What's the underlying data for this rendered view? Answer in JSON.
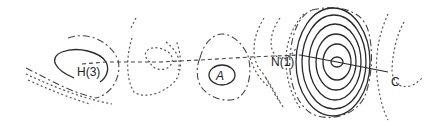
{
  "diagram": {
    "type": "contour-map",
    "labels": {
      "h3": "H(3)",
      "a": "A",
      "n1": "N(1)",
      "c": "C"
    },
    "contour_styles": {
      "positive": "solid",
      "zero": "dash-dot",
      "negative": "dotted"
    },
    "connections": [
      {
        "from": "H(3)",
        "to": "N(1)",
        "style": "dashed"
      },
      {
        "from": "N(1)",
        "to": "C",
        "style": "solid"
      }
    ],
    "colors": {
      "line": "#2a2a2a",
      "background": "#ffffff"
    }
  }
}
